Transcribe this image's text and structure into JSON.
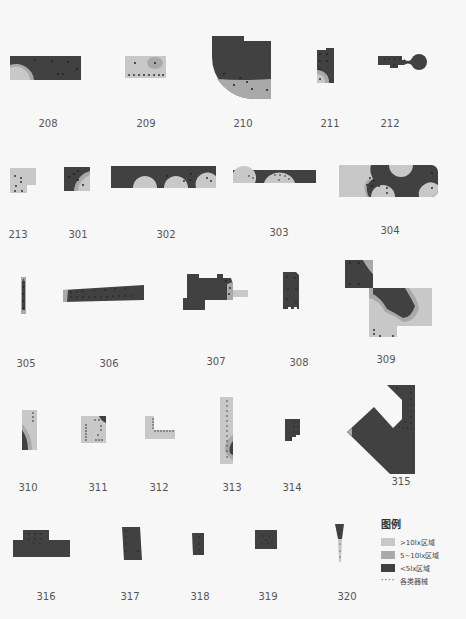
{
  "colors": {
    "light": "#c8c8c8",
    "mid": "#a9a9a9",
    "dark": "#414141",
    "dot": "#222222"
  },
  "rooms": [
    {
      "id": "208"
    },
    {
      "id": "209"
    },
    {
      "id": "210"
    },
    {
      "id": "211"
    },
    {
      "id": "212"
    },
    {
      "id": "213"
    },
    {
      "id": "301"
    },
    {
      "id": "302"
    },
    {
      "id": "303"
    },
    {
      "id": "304"
    },
    {
      "id": "305"
    },
    {
      "id": "306"
    },
    {
      "id": "307"
    },
    {
      "id": "308"
    },
    {
      "id": "309"
    },
    {
      "id": "310"
    },
    {
      "id": "311"
    },
    {
      "id": "312"
    },
    {
      "id": "313"
    },
    {
      "id": "314"
    },
    {
      "id": "315"
    },
    {
      "id": "316"
    },
    {
      "id": "317"
    },
    {
      "id": "318"
    },
    {
      "id": "319"
    },
    {
      "id": "320"
    }
  ],
  "legend": {
    "title": "图例",
    "items": [
      {
        "label": ">10lx区域",
        "color": "#c8c8c8"
      },
      {
        "label": "5~10lx区域",
        "color": "#a9a9a9"
      },
      {
        "label": "<5lx区域",
        "color": "#414141"
      },
      {
        "label": "各类器械",
        "marker": "dots"
      }
    ]
  }
}
